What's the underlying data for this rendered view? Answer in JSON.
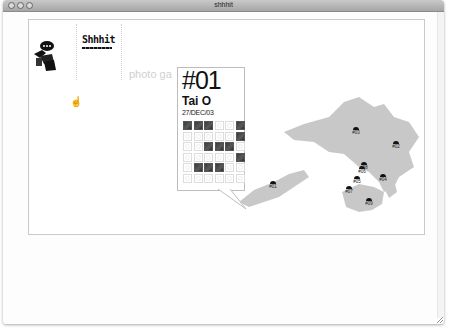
{
  "window": {
    "title": "shhhit",
    "traffic_lights": [
      "close",
      "minimize",
      "zoom"
    ]
  },
  "logo": {
    "wordmark": "Shhhit",
    "icon": "figure-with-speech-bubble-icon"
  },
  "nav": {
    "photo_gallery_label": "photo ga"
  },
  "popup": {
    "number": "#01",
    "place": "Tai O",
    "date": "27/DEC/03",
    "grid": {
      "rows": 6,
      "cols": 6,
      "filled": [
        [
          0,
          0
        ],
        [
          0,
          1
        ],
        [
          0,
          2
        ],
        [
          0,
          5
        ],
        [
          1,
          5
        ],
        [
          2,
          2
        ],
        [
          2,
          3
        ],
        [
          2,
          4
        ],
        [
          3,
          5
        ],
        [
          4,
          1
        ],
        [
          4,
          2
        ],
        [
          4,
          3
        ]
      ]
    }
  },
  "map": {
    "region": "Hong Kong",
    "markers": [
      {
        "label": "#01",
        "x": 37,
        "y": 110
      },
      {
        "label": "#02",
        "x": 160,
        "y": 70
      },
      {
        "label": "#03",
        "x": 120,
        "y": 56
      },
      {
        "label": "#04",
        "x": 147,
        "y": 103
      },
      {
        "label": "#05",
        "x": 121,
        "y": 105
      },
      {
        "label": "#06",
        "x": 126,
        "y": 95
      },
      {
        "label": "#07",
        "x": 113,
        "y": 115
      },
      {
        "label": "#08",
        "x": 128,
        "y": 91
      },
      {
        "label": "#09",
        "x": 133,
        "y": 127
      }
    ]
  },
  "colors": {
    "land": "#c8c8c8",
    "ink": "#111111",
    "border": "#c9c9c9"
  }
}
